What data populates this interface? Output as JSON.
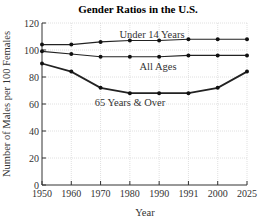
{
  "chart_data": {
    "type": "line",
    "title": "Gender Ratios in the U.S.",
    "xlabel": "Year",
    "ylabel": "Number of Males per 100 Females",
    "categories": [
      "1950",
      "1960",
      "1970",
      "1980",
      "1990",
      "1991",
      "2000",
      "2025"
    ],
    "ylim": [
      0,
      120
    ],
    "yticks": [
      0,
      20,
      40,
      60,
      80,
      100,
      120
    ],
    "grid": true,
    "legend": "inline labels",
    "series": [
      {
        "name": "Under 14 Years",
        "values": [
          104,
          104,
          106,
          107,
          107,
          108,
          108,
          108
        ]
      },
      {
        "name": "All Ages",
        "values": [
          99,
          97,
          95,
          95,
          95,
          96,
          96,
          96
        ]
      },
      {
        "name": "65 Years & Over",
        "values": [
          90,
          84,
          72,
          68,
          68,
          68,
          72,
          84
        ]
      }
    ]
  }
}
